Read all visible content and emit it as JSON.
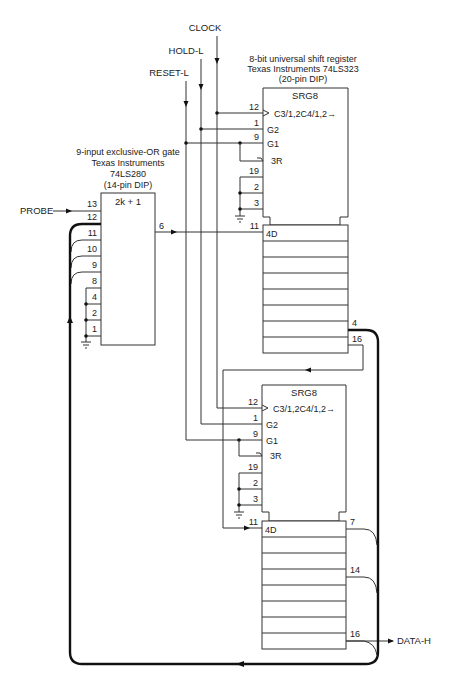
{
  "signals": {
    "clock": "CLOCK",
    "hold": "HOLD-L",
    "reset": "RESET-L",
    "probe": "PROBE",
    "data_out": "DATA-H"
  },
  "gate": {
    "title_lines": [
      "9-input exclusive-OR gate",
      "Texas Instruments",
      "74LS280",
      "(14-pin DIP)"
    ],
    "symbol": "2k + 1",
    "input_pins": [
      "13",
      "12",
      "11",
      "10",
      "9",
      "8",
      "4",
      "2",
      "1"
    ],
    "output_pin": "6"
  },
  "register_upper": {
    "title_lines": [
      "8-bit universal shift register",
      "Texas Instruments 74LS323",
      "(20-pin DIP)"
    ],
    "symbol": "SRG8",
    "control_pins": [
      "12",
      "1",
      "9",
      "19",
      "2",
      "3"
    ],
    "control_labels": [
      "C3/1,2C4/1,2→",
      "G2",
      "G1",
      "3R"
    ],
    "data_in_pin": "11",
    "data_in_label": "4D",
    "output_pins": [
      "4",
      "16"
    ]
  },
  "register_lower": {
    "symbol": "SRG8",
    "control_pins": [
      "12",
      "1",
      "9",
      "19",
      "2",
      "3"
    ],
    "control_labels": [
      "C3/1,2C4/1,2→",
      "G2",
      "G1",
      "3R"
    ],
    "data_in_pin": "11",
    "data_in_label": "4D",
    "output_pins": [
      "7",
      "14",
      "16"
    ]
  }
}
